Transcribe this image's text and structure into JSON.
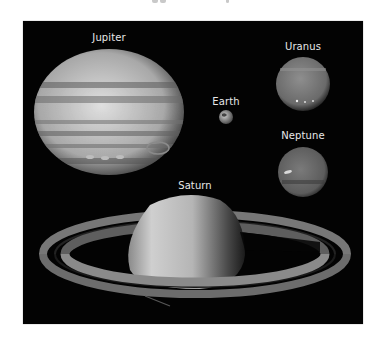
{
  "figure": {
    "background": "#030303",
    "planets": [
      {
        "name": "Jupiter",
        "label": "Jupiter"
      },
      {
        "name": "Earth",
        "label": "Earth"
      },
      {
        "name": "Uranus",
        "label": "Uranus"
      },
      {
        "name": "Neptune",
        "label": "Neptune"
      },
      {
        "name": "Saturn",
        "label": "Saturn"
      }
    ]
  }
}
